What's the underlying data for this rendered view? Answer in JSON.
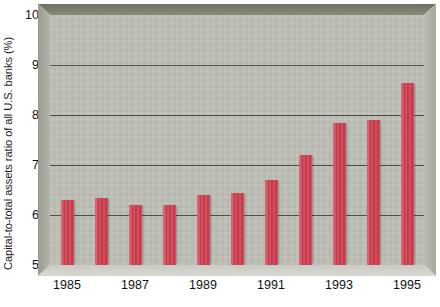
{
  "chart_data": {
    "type": "bar",
    "title": "",
    "xlabel": "",
    "ylabel": "Capital-to-total assets ratio of all U.S. banks (%)",
    "categories": [
      "1985",
      "1986",
      "1987",
      "1988",
      "1989",
      "1990",
      "1991",
      "1992",
      "1993",
      "1994",
      "1995"
    ],
    "values": [
      6.3,
      6.35,
      6.2,
      6.2,
      6.4,
      6.45,
      6.7,
      7.2,
      7.85,
      7.9,
      8.65
    ],
    "ylim": [
      5,
      10
    ],
    "ytick_labels": [
      "10",
      "9",
      "8",
      "7",
      "6",
      "5"
    ],
    "ytick_values": [
      10,
      9,
      8,
      7,
      6,
      5
    ],
    "xtick_labels": [
      "1985",
      "1987",
      "1989",
      "1991",
      "1993",
      "1995"
    ],
    "xtick_categories": [
      "1985",
      "1987",
      "1989",
      "1991",
      "1993",
      "1995"
    ],
    "gridlines": true,
    "grid_axis": "y",
    "legend": "none",
    "bar_color": "#cf3f4f",
    "plot_background": "#bdbeb6",
    "frame_color": "#7e8073",
    "gridline_color": "#3b3b36",
    "text_color": "#111111"
  }
}
